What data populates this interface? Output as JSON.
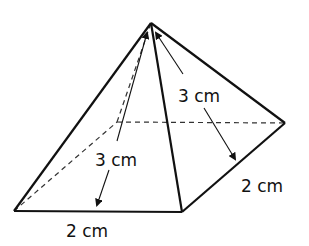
{
  "figure": {
    "type": "square-based pyramid",
    "labels": {
      "slant_height_front": "3 cm",
      "slant_height_right": "3 cm",
      "base_front_edge": "2 cm",
      "base_right_edge": "2 cm"
    },
    "colors": {
      "stroke": "#111111",
      "background": "#ffffff"
    }
  }
}
